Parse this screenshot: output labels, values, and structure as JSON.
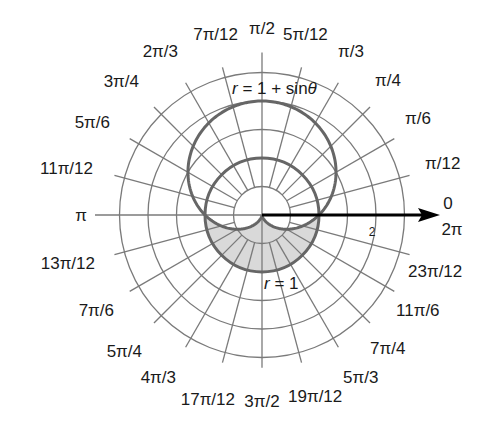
{
  "diagram": {
    "center_px": [
      262,
      215
    ],
    "scale_px_per_unit": 57,
    "ring_radii": [
      0.5,
      1,
      1.5,
      2,
      2.5
    ],
    "radial_step": "π/12",
    "colors": {
      "grid": "#7a7a7a",
      "curve": "#666666",
      "shade": "#d9d9d9",
      "axis_arrow": "#000000",
      "text": "#1a1a1a"
    },
    "curves": [
      {
        "name": "cardioid",
        "equation_parts": [
          "r",
          " = 1 + sin",
          "θ"
        ]
      },
      {
        "name": "unit-circle",
        "equation_parts": [
          "r",
          " = 1"
        ]
      }
    ],
    "shaded_region": "inside r = 1, outside r = 1 + sin θ, for π ≤ θ ≤ 2π",
    "axis_tick_label": "2",
    "angle_labels": [
      {
        "text": "0",
        "x": 448,
        "y": 209,
        "anchor": "middle"
      },
      {
        "text": "2π",
        "x": 452,
        "y": 235,
        "anchor": "middle"
      },
      {
        "text": "π/12",
        "x": 425,
        "y": 169,
        "anchor": "start"
      },
      {
        "text": "π/6",
        "x": 405,
        "y": 124,
        "anchor": "start"
      },
      {
        "text": "π/4",
        "x": 375,
        "y": 86,
        "anchor": "start"
      },
      {
        "text": "π/3",
        "x": 338,
        "y": 57,
        "anchor": "start"
      },
      {
        "text": "5π/12",
        "x": 283,
        "y": 40,
        "anchor": "start"
      },
      {
        "text": "π/2",
        "x": 262,
        "y": 34,
        "anchor": "middle"
      },
      {
        "text": "7π/12",
        "x": 238,
        "y": 40,
        "anchor": "end"
      },
      {
        "text": "2π/3",
        "x": 178,
        "y": 57,
        "anchor": "end"
      },
      {
        "text": "3π/4",
        "x": 139,
        "y": 87,
        "anchor": "end"
      },
      {
        "text": "5π/6",
        "x": 110,
        "y": 128,
        "anchor": "end"
      },
      {
        "text": "11π/12",
        "x": 93,
        "y": 174,
        "anchor": "end"
      },
      {
        "text": "π",
        "x": 87,
        "y": 221,
        "anchor": "end"
      },
      {
        "text": "13π/12",
        "x": 95,
        "y": 269,
        "anchor": "end"
      },
      {
        "text": "7π/6",
        "x": 114,
        "y": 316,
        "anchor": "end"
      },
      {
        "text": "5π/4",
        "x": 142,
        "y": 357,
        "anchor": "end"
      },
      {
        "text": "4π/3",
        "x": 176,
        "y": 383,
        "anchor": "end"
      },
      {
        "text": "17π/12",
        "x": 235,
        "y": 405,
        "anchor": "end"
      },
      {
        "text": "3π/2",
        "x": 262,
        "y": 407,
        "anchor": "middle"
      },
      {
        "text": "19π/12",
        "x": 288,
        "y": 402,
        "anchor": "start"
      },
      {
        "text": "5π/3",
        "x": 343,
        "y": 383,
        "anchor": "start"
      },
      {
        "text": "7π/4",
        "x": 370,
        "y": 354,
        "anchor": "start"
      },
      {
        "text": "11π/6",
        "x": 396,
        "y": 316,
        "anchor": "start"
      },
      {
        "text": "23π/12",
        "x": 408,
        "y": 277,
        "anchor": "start"
      }
    ]
  }
}
